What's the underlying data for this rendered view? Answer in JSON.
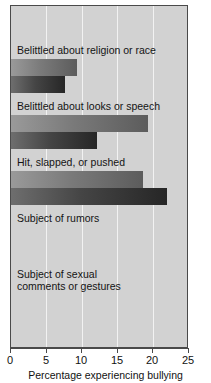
{
  "chart_data": {
    "type": "bar",
    "orientation": "horizontal",
    "title": "",
    "xlabel": "Percentage experiencing bullying",
    "ylabel": "",
    "xlim": [
      0,
      25
    ],
    "xticks": [
      0,
      5,
      10,
      15,
      20,
      25
    ],
    "grid": true,
    "legend_position": "top-center",
    "categories": [
      "Belittled about religion or race",
      "Belittled about looks or speech",
      "Hit, slapped, or pushed",
      "Subject of rumors",
      "Subject of sexual\ncomments or gestures"
    ],
    "series": [
      {
        "name": "Males",
        "color": "#7a7a7a",
        "values": [
          9.4,
          20.9,
          19.4,
          17.8,
          18.8
        ]
      },
      {
        "name": "Females",
        "color": "#3b3b3b",
        "values": [
          7.6,
          21.9,
          12.2,
          18.7,
          22.1
        ]
      }
    ]
  },
  "legend": {
    "entries": [
      {
        "label": "Males"
      },
      {
        "label": "Females"
      }
    ]
  },
  "axis": {
    "ticks": [
      "0",
      "5",
      "10",
      "15",
      "20",
      "25"
    ],
    "xlabel": "Percentage experiencing bullying"
  },
  "colors": {
    "plot_background": "#d2d2d2",
    "gridline": "#f2f2f2",
    "frame": "#4a4a4a",
    "males_bar": "#7a7a7a",
    "females_bar": "#3b3b3b",
    "text": "#141414"
  }
}
